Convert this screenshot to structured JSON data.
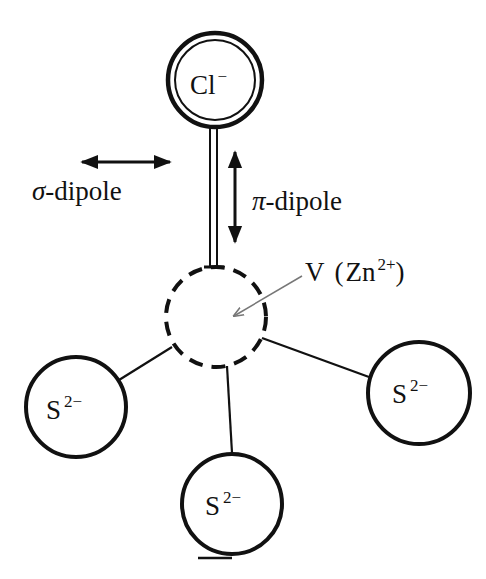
{
  "colors": {
    "ink": "#111111",
    "pointer": "#777777",
    "background": "#ffffff"
  },
  "nodes": {
    "chloride": {
      "symbol": "Cl",
      "charge": "−",
      "style": "double-circle"
    },
    "vacancy": {
      "symbol": "V",
      "paren_open": "(",
      "site": "Zn",
      "site_charge": "2+",
      "paren_close": ")",
      "style": "dashed-circle"
    },
    "sulfur_left": {
      "symbol": "S",
      "charge": "2−"
    },
    "sulfur_right": {
      "symbol": "S",
      "charge": "2−"
    },
    "sulfur_bottom": {
      "symbol": "S",
      "charge": "2−"
    }
  },
  "labels": {
    "sigma": {
      "greek": "σ",
      "text": "-dipole"
    },
    "pi": {
      "greek": "π",
      "text": "-dipole"
    }
  }
}
